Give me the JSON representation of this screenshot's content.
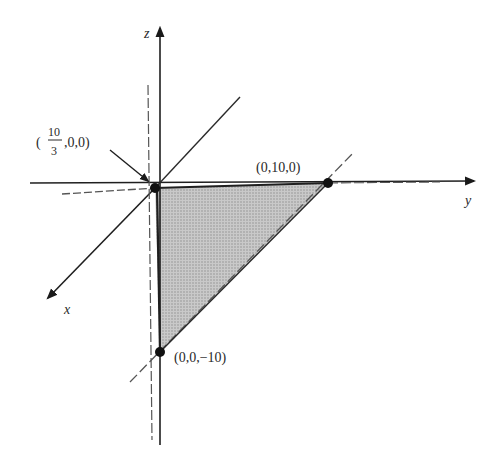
{
  "figure": {
    "type": "3d-plane-intercepts",
    "axes": {
      "x": {
        "label": "x"
      },
      "y": {
        "label": "y"
      },
      "z": {
        "label": "z"
      }
    },
    "points": [
      {
        "id": "x-intercept",
        "label_open": "(",
        "label_num": "10",
        "label_den": "3",
        "label_rest": ",0,0)"
      },
      {
        "id": "y-intercept",
        "label": "(0,10,0)"
      },
      {
        "id": "z-intercept",
        "label": "(0,0,−10)"
      }
    ],
    "colors": {
      "axis": "#1f1f1f",
      "shade": "#b5b5b5",
      "point": "#111111",
      "dashed": "#555555"
    }
  }
}
